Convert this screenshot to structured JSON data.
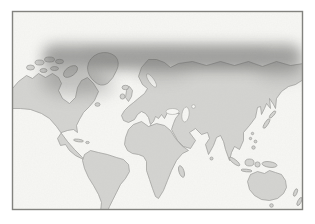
{
  "figure": {
    "type": "world-distribution-map",
    "depicted_regions": [
      "north-america",
      "canadian-arctic-islands",
      "greenland",
      "iceland",
      "south-america",
      "british-isles",
      "europe",
      "africa",
      "madagascar",
      "asia",
      "india",
      "arabia",
      "japan",
      "indonesia",
      "new-guinea",
      "australia",
      "tasmania",
      "new-zealand",
      "caribbean"
    ],
    "highlighted_range": "circumpolar-northern-band",
    "colors": {
      "page_bg": "#ffffff",
      "ocean": "#f7f7f4",
      "land": "#d4d4d1",
      "greenland": "#d8d8d5",
      "coastline": "#9a9a97",
      "band": "#5a5a58",
      "frame": "#82827e"
    }
  }
}
